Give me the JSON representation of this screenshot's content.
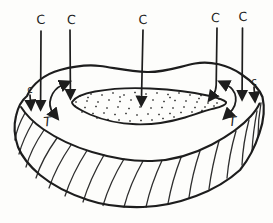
{
  "diagram": {
    "ink_color": "#1d1d1d",
    "paper_color": "#fdfdfb",
    "labels": {
      "c_top": [
        "C",
        "C",
        "C",
        "C",
        "C"
      ],
      "c_small_left": "c",
      "c_small_right": "c",
      "t_left": "T",
      "t_right": "T"
    }
  }
}
